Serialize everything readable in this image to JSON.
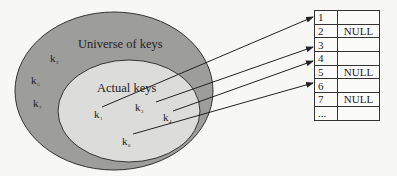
{
  "diagram": {
    "type": "direct-address-table",
    "universe": {
      "label": "Universe of keys",
      "keys": [
        {
          "name": "k",
          "sub": "2"
        },
        {
          "name": "k",
          "sub": "5"
        },
        {
          "name": "k",
          "sub": "7"
        }
      ]
    },
    "actual": {
      "label": "Actual keys",
      "keys": [
        {
          "name": "k",
          "sub": "1",
          "slot": 1
        },
        {
          "name": "k",
          "sub": "3",
          "slot": 3
        },
        {
          "name": "k",
          "sub": "4",
          "slot": 4
        },
        {
          "name": "k",
          "sub": "6",
          "slot": 6
        }
      ]
    },
    "table": {
      "rows": [
        {
          "index": "1",
          "value": ""
        },
        {
          "index": "2",
          "value": "NULL"
        },
        {
          "index": "3",
          "value": ""
        },
        {
          "index": "4",
          "value": ""
        },
        {
          "index": "5",
          "value": "NULL"
        },
        {
          "index": "6",
          "value": ""
        },
        {
          "index": "7",
          "value": "NULL"
        },
        {
          "index": "...",
          "value": ""
        }
      ]
    },
    "colors": {
      "outer_fill": "#9d9d9b",
      "inner_fill": "#dcdcda",
      "stroke": "#333333",
      "background": "#f7f7f6"
    }
  }
}
